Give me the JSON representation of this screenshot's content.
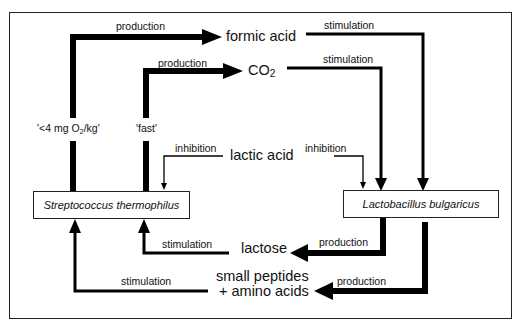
{
  "diagram": {
    "nodes": {
      "strep": "Streptococcus  thermophilus",
      "lacto": "Lactobacillus  bulgaricus",
      "formic": "formic  acid",
      "co2_main": "CO",
      "co2_sub": "2",
      "lactic": "lactic  acid",
      "lactose": "lactose",
      "peptides_line1": "small  peptides",
      "peptides_line2": "+  amino  acids"
    },
    "edges": [
      {
        "from": "strep",
        "to": "formic",
        "label": "production",
        "weight": "thick"
      },
      {
        "from": "strep",
        "to": "co2",
        "label": "production",
        "weight": "thick"
      },
      {
        "from": "formic",
        "to": "lacto",
        "label": "stimulation",
        "weight": "medium"
      },
      {
        "from": "co2",
        "to": "lacto",
        "label": "stimulation",
        "weight": "medium"
      },
      {
        "from": "lactic",
        "to": "strep",
        "label": "inhibition",
        "weight": "thin"
      },
      {
        "from": "lactic",
        "to": "lacto",
        "label": "inhibition",
        "weight": "thin"
      },
      {
        "from": "lacto",
        "to": "lactose",
        "label": "production",
        "weight": "thick"
      },
      {
        "from": "lacto",
        "to": "peptides",
        "label": "production",
        "weight": "thick"
      },
      {
        "from": "lactose",
        "to": "strep",
        "label": "stimulation",
        "weight": "medium"
      },
      {
        "from": "peptides",
        "to": "strep",
        "label": "stimulation",
        "weight": "medium"
      }
    ],
    "labels": {
      "prod_formic": "production",
      "prod_co2": "production",
      "stim_formic": "stimulation",
      "stim_co2": "stimulation",
      "inhib_left": "inhibition",
      "inhib_right": "inhibition",
      "prod_lactose": "production",
      "prod_peptides": "production",
      "stim_lactose": "stimulation",
      "stim_peptides": "stimulation",
      "condition_oxygen_pre": "'<4  mg  O",
      "condition_oxygen_sub": "2",
      "condition_oxygen_post": "/kg'",
      "condition_fast": "'fast'"
    }
  }
}
